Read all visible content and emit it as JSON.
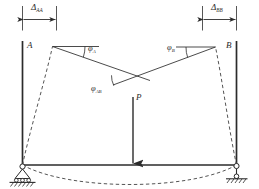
{
  "figure": {
    "name": "portal-frame-deflection-diagram",
    "type": "structural-mechanics-diagram",
    "width": 259,
    "height": 189,
    "background_color": "#ffffff",
    "line_color": "#2b2b2b",
    "dashed_color": "#555555"
  },
  "dimensions": {
    "left": {
      "symbol": "Δ",
      "subscript": "AA",
      "full": "ΔAA",
      "arrow_style": "double-headed",
      "position": "top-left"
    },
    "right": {
      "symbol": "Δ",
      "subscript": "BB",
      "full": "ΔBB",
      "arrow_style": "double-headed",
      "position": "top-right"
    }
  },
  "nodes": {
    "left": {
      "label": "A"
    },
    "right": {
      "label": "B"
    }
  },
  "angles": [
    {
      "id": "phi-a",
      "symbol": "φ",
      "subscript": "A",
      "full": "φA"
    },
    {
      "id": "phi-b",
      "symbol": "φ",
      "subscript": "B",
      "full": "φB"
    },
    {
      "id": "phi-ab",
      "symbol": "φ",
      "subscript": "AB",
      "full": "φAB"
    }
  ],
  "load": {
    "label": "P",
    "direction": "downward",
    "position": "midspan"
  },
  "supports": {
    "left": {
      "type": "pin-rocker-on-hatched-ground",
      "icon": "pin-support-icon"
    },
    "right": {
      "type": "link-rocker-on-hatched-ground",
      "icon": "roller-support-icon"
    }
  },
  "elements": {
    "left_column": "vertical-member-A",
    "right_column": "vertical-member-B",
    "bottom_beam": "horizontal-beam-AB",
    "deformed_shape": "dashed-deflected-configuration",
    "chord_lines": "tangent-chord-lines"
  }
}
